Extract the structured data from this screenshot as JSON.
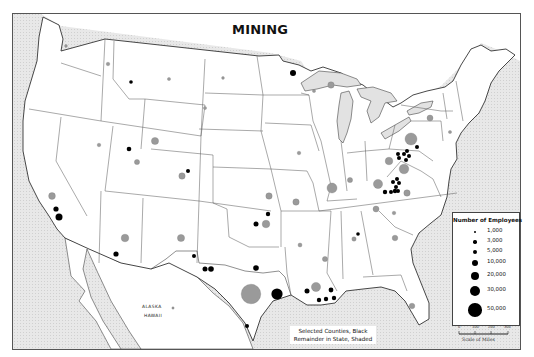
{
  "title": "MINING",
  "legend": {
    "title": "Number of Employees",
    "items": [
      {
        "label": "1,000",
        "size": 2.2
      },
      {
        "label": "3,000",
        "size": 3.4
      },
      {
        "label": "5,000",
        "size": 4.6
      },
      {
        "label": "10,000",
        "size": 6.2
      },
      {
        "label": "20,000",
        "size": 8.4
      },
      {
        "label": "30,000",
        "size": 10.2
      },
      {
        "label": "50,000",
        "size": 13.6
      }
    ]
  },
  "scale": {
    "ticks": [
      "0",
      "100",
      "200",
      "300"
    ],
    "caption": "Scale of Miles"
  },
  "caption": {
    "line1": "Selected Counties, Black",
    "line2": "Remainder in State, Shaded"
  },
  "inset_labels": {
    "alaska": "ALASKA",
    "hawaii": "HAWAII"
  },
  "colors": {
    "water": "#e4e4e4",
    "land": "#ffffff",
    "state_border": "#444444",
    "county_dot": "#000000",
    "state_dot": "#9a9a9a"
  },
  "dots": {
    "county_black": [
      [
        130,
        81,
        1.8
      ],
      [
        128,
        148,
        2.3
      ],
      [
        187,
        170,
        2.0
      ],
      [
        55,
        208,
        2.6
      ],
      [
        58,
        216,
        3.5
      ],
      [
        292,
        72,
        3.0
      ],
      [
        267,
        213,
        2.2
      ],
      [
        255,
        223,
        2.5
      ],
      [
        115,
        253,
        2.6
      ],
      [
        193,
        255,
        2.0
      ],
      [
        204,
        268,
        2.5
      ],
      [
        210,
        268,
        2.8
      ],
      [
        255,
        267,
        2.8
      ],
      [
        276,
        293,
        5.6
      ],
      [
        246,
        325,
        2.0
      ],
      [
        306,
        290,
        2.5
      ],
      [
        318,
        299,
        2.2
      ],
      [
        325,
        298,
        2.2
      ],
      [
        330,
        289,
        2.4
      ],
      [
        333,
        297,
        2.2
      ],
      [
        357,
        233,
        1.8
      ],
      [
        397,
        153,
        2.0
      ],
      [
        398,
        157,
        2.0
      ],
      [
        403,
        153,
        2.0
      ],
      [
        406,
        150,
        2.0
      ],
      [
        408,
        155,
        2.0
      ],
      [
        405,
        159,
        2.0
      ],
      [
        416,
        146,
        2.0
      ],
      [
        392,
        181,
        2.0
      ],
      [
        395,
        186,
        2.0
      ],
      [
        398,
        182,
        2.0
      ],
      [
        394,
        190,
        2.2
      ],
      [
        390,
        191,
        2.0
      ],
      [
        384,
        191,
        2.2
      ],
      [
        396,
        178,
        2.0
      ],
      [
        397,
        190,
        2.0
      ]
    ],
    "state_shaded": [
      [
        65,
        45,
        1.4
      ],
      [
        107,
        63,
        1.8
      ],
      [
        168,
        78,
        1.6
      ],
      [
        222,
        77,
        1.4
      ],
      [
        204,
        107,
        1.6
      ],
      [
        98,
        144,
        1.8
      ],
      [
        154,
        140,
        3.6
      ],
      [
        136,
        161,
        2.6
      ],
      [
        181,
        175,
        3.2
      ],
      [
        51,
        195,
        3.4
      ],
      [
        124,
        237,
        3.8
      ],
      [
        180,
        237,
        3.6
      ],
      [
        265,
        223,
        3.8
      ],
      [
        268,
        195,
        3.2
      ],
      [
        295,
        201,
        3.2
      ],
      [
        298,
        152,
        1.8
      ],
      [
        330,
        84,
        3.2
      ],
      [
        313,
        90,
        1.6
      ],
      [
        331,
        187,
        5.0
      ],
      [
        349,
        179,
        2.6
      ],
      [
        388,
        160,
        3.8
      ],
      [
        403,
        168,
        4.8
      ],
      [
        377,
        183,
        4.6
      ],
      [
        406,
        192,
        3.2
      ],
      [
        410,
        138,
        6.0
      ],
      [
        429,
        117,
        3.0
      ],
      [
        449,
        131,
        1.6
      ],
      [
        375,
        208,
        3.0
      ],
      [
        393,
        212,
        1.8
      ],
      [
        353,
        238,
        2.2
      ],
      [
        394,
        237,
        2.8
      ],
      [
        324,
        258,
        2.6
      ],
      [
        299,
        244,
        2.0
      ],
      [
        315,
        286,
        4.6
      ],
      [
        411,
        305,
        2.8
      ],
      [
        250,
        293,
        9.8
      ],
      [
        172,
        307,
        1.2
      ]
    ]
  }
}
